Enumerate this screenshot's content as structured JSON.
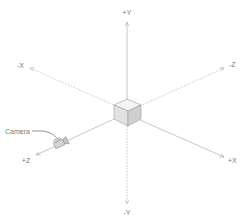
{
  "diagram": {
    "type": "3d-coordinate-axes",
    "colors": {
      "axis_line": "#b8b8b8",
      "axis_dotted": "#b8b8b8",
      "label": "#777777",
      "cube_top": "#f2f2f2",
      "cube_left": "#e0e0e0",
      "cube_right": "#cfcfcf",
      "cube_edge": "#9a9a9a"
    },
    "axes": {
      "pos_y": {
        "label": "+Y"
      },
      "neg_y": {
        "label": "-Y"
      },
      "pos_x": {
        "label": "+X"
      },
      "neg_x": {
        "label": "-X"
      },
      "pos_z": {
        "label": "+Z"
      },
      "neg_z": {
        "label": "-Z"
      }
    },
    "callouts": {
      "camera": {
        "label": "Camera"
      }
    }
  }
}
